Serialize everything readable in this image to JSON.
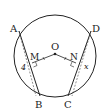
{
  "figure": {
    "circle": {
      "cx": 55,
      "cy": 56,
      "r": 41
    },
    "points": {
      "A": {
        "label": "A",
        "x": 19,
        "y": 31,
        "lx": 10,
        "ly": 32
      },
      "B": {
        "label": "B",
        "x": 40,
        "y": 96,
        "lx": 35,
        "ly": 108
      },
      "C": {
        "label": "C",
        "x": 68,
        "y": 96,
        "lx": 64,
        "ly": 108
      },
      "D": {
        "label": "D",
        "x": 91,
        "y": 31,
        "lx": 92,
        "ly": 32
      },
      "O": {
        "label": "O",
        "x": 55,
        "y": 54,
        "lx": 51,
        "ly": 50
      },
      "M": {
        "label": "M",
        "x": 32,
        "y": 63,
        "lx": 30,
        "ly": 60
      },
      "N": {
        "label": "N",
        "x": 76,
        "y": 63,
        "lx": 70,
        "ly": 60
      }
    },
    "lengths": {
      "AB": {
        "label": "4",
        "x": 22,
        "y": 70
      },
      "CD": {
        "label": "x",
        "x": 85,
        "y": 69
      }
    },
    "stroke_color": "#222222"
  }
}
